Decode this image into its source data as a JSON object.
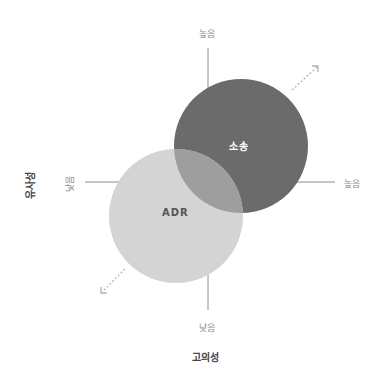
{
  "diagram": {
    "x_axis": {
      "title": "고의성",
      "low_label": "낮음",
      "high_label": "높음"
    },
    "y_axis": {
      "title": "유사성",
      "low_label": "낮음",
      "high_label": "높음"
    },
    "circles": [
      {
        "label": "소송",
        "color": "#6b6b6b",
        "label_color": "#ffffff"
      },
      {
        "label": "ADR",
        "color": "#d4d4d4",
        "label_color": "#555555"
      }
    ],
    "overlap_color": "#9e9e9e",
    "arrow_color": "#b5b5b5",
    "axis_color": "#8c8c8c"
  }
}
